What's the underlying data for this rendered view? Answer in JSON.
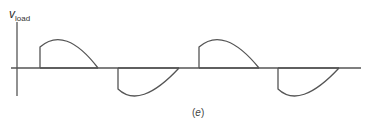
{
  "figure": {
    "y_label": {
      "main": "v",
      "subscript": "load"
    },
    "caption": {
      "open": "(",
      "letter": "e",
      "close": ")"
    },
    "colors": {
      "stroke": "#555555",
      "background": "#ffffff"
    }
  }
}
